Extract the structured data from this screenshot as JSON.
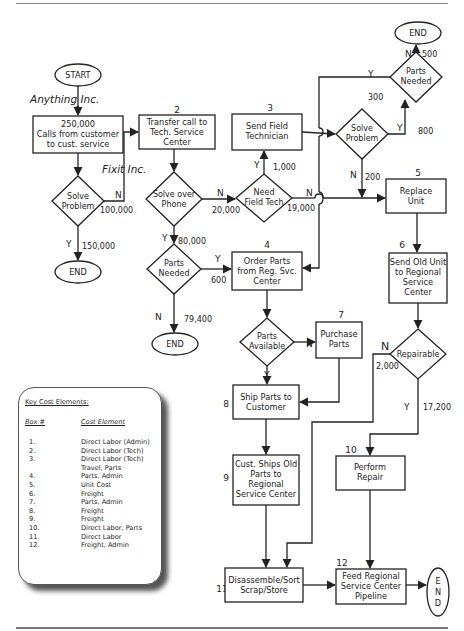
{
  "companies": {
    "first": "Anything  Inc.",
    "second": "Fixit  Inc."
  },
  "terminals": {
    "start": "START",
    "end_top_right": "END",
    "end_left": "END",
    "end_middle": "END",
    "end_vertical": [
      "E",
      "N",
      "D"
    ]
  },
  "boxes": {
    "b1": {
      "num": "1",
      "lines": [
        "250,000",
        "Calls from customer",
        "to cust. service"
      ]
    },
    "b2": {
      "num": "2",
      "lines": [
        "Transfer call to",
        "Tech. Service",
        "Center"
      ]
    },
    "b3": {
      "num": "3",
      "lines": [
        "Send Field",
        "Technician"
      ]
    },
    "b4": {
      "num": "4",
      "lines": [
        "Order Parts",
        "from Reg. Svc.",
        "Center"
      ]
    },
    "b5": {
      "num": "5",
      "lines": [
        "Replace",
        "Unit"
      ]
    },
    "b6": {
      "num": "6",
      "lines": [
        "Send Old Unit",
        "to Regional",
        "Service",
        "Center"
      ]
    },
    "b7": {
      "num": "7",
      "lines": [
        "Purchase",
        "Parts"
      ]
    },
    "b8": {
      "num": "8",
      "lines": [
        "Ship Parts to",
        "Customer"
      ]
    },
    "b9": {
      "num": "9",
      "lines": [
        "Cust. Ships Old",
        "Parts to",
        "Regional",
        "Service Center"
      ]
    },
    "b10": {
      "num": "10",
      "lines": [
        "Perform",
        "Repair"
      ]
    },
    "b11": {
      "num": "11",
      "lines": [
        "Disassemble/Sort",
        "Scrap/Store"
      ]
    },
    "b12": {
      "num": "12",
      "lines": [
        "Feed Regional",
        "Service Center",
        "Pipeline"
      ]
    }
  },
  "decisions": {
    "d_solve1": [
      "Solve",
      "Problem"
    ],
    "d_phone": [
      "Solve over",
      "Phone"
    ],
    "d_fieldtech": [
      "Need",
      "Field Tech"
    ],
    "d_solve2": [
      "Solve",
      "Problem"
    ],
    "d_partsneeded_top": [
      "Parts",
      "Needed"
    ],
    "d_partsneeded_mid": [
      "Parts",
      "Needed"
    ],
    "d_available": [
      "Parts",
      "Available"
    ],
    "d_repairable": [
      "Repairable"
    ]
  },
  "flow_labels": {
    "y": "Y",
    "n": "N",
    "v100000": "100,000",
    "v150000": "150,000",
    "v20000": "20,000",
    "v80000": "80,000",
    "v1000": "1,000",
    "v19000": "19,000",
    "v600": "600",
    "v79400": "79,400",
    "v300": "300",
    "v500": "500",
    "v800": "800",
    "v200": "200",
    "v2000": "2,000",
    "v17200": "17,200"
  },
  "key": {
    "title": "Key Cost Elements:",
    "col_box": "Box #",
    "col_cost": "Cost Element",
    "rows": [
      {
        "n": "1.",
        "c": "Direct Labor (Admin)"
      },
      {
        "n": "2.",
        "c": "Direct Labor (Tech)"
      },
      {
        "n": "3.",
        "c": "Direct Labor (Tech)"
      },
      {
        "n": "",
        "c": "Travel, Parts"
      },
      {
        "n": "4.",
        "c": "Parts, Admin"
      },
      {
        "n": "5.",
        "c": "Unit Cost"
      },
      {
        "n": "6.",
        "c": "Freight"
      },
      {
        "n": "7.",
        "c": "Parts, Admin"
      },
      {
        "n": "8.",
        "c": "Freight"
      },
      {
        "n": "9.",
        "c": "Freight"
      },
      {
        "n": "10.",
        "c": "Direct Labor, Parts"
      },
      {
        "n": "11.",
        "c": "Direct Labor"
      },
      {
        "n": "12.",
        "c": "Freight, Admin"
      }
    ]
  }
}
